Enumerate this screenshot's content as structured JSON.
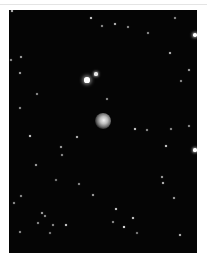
{
  "image": {
    "subject": "star field with central nebula",
    "background_color": "#ffffff",
    "sky_color": "#050505",
    "frame": {
      "left": 9,
      "top": 10,
      "width": 188,
      "height": 243
    }
  },
  "central_object": {
    "x": 103,
    "y": 121,
    "size": 16
  },
  "stars": [
    {
      "x": 87,
      "y": 80,
      "r": 2.6,
      "o": 1.0
    },
    {
      "x": 96,
      "y": 74,
      "r": 1.6,
      "o": 0.9
    },
    {
      "x": 195,
      "y": 35,
      "r": 1.8,
      "o": 1.0
    },
    {
      "x": 195,
      "y": 150,
      "r": 1.6,
      "o": 1.0
    },
    {
      "x": 91,
      "y": 18,
      "r": 1.2,
      "o": 0.9
    },
    {
      "x": 115,
      "y": 24,
      "r": 1.1,
      "o": 0.8
    },
    {
      "x": 102,
      "y": 26,
      "r": 0.9,
      "o": 0.6
    },
    {
      "x": 128,
      "y": 27,
      "r": 0.9,
      "o": 0.6
    },
    {
      "x": 148,
      "y": 33,
      "r": 0.9,
      "o": 0.6
    },
    {
      "x": 175,
      "y": 18,
      "r": 0.9,
      "o": 0.6
    },
    {
      "x": 170,
      "y": 53,
      "r": 1.1,
      "o": 0.8
    },
    {
      "x": 189,
      "y": 70,
      "r": 1.0,
      "o": 0.7
    },
    {
      "x": 181,
      "y": 81,
      "r": 0.9,
      "o": 0.6
    },
    {
      "x": 21,
      "y": 57,
      "r": 1.0,
      "o": 0.7
    },
    {
      "x": 20,
      "y": 73,
      "r": 1.0,
      "o": 0.7
    },
    {
      "x": 11,
      "y": 60,
      "r": 0.9,
      "o": 0.6
    },
    {
      "x": 37,
      "y": 94,
      "r": 0.9,
      "o": 0.6
    },
    {
      "x": 20,
      "y": 108,
      "r": 0.9,
      "o": 0.6
    },
    {
      "x": 107,
      "y": 99,
      "r": 0.9,
      "o": 0.6
    },
    {
      "x": 135,
      "y": 129,
      "r": 1.1,
      "o": 0.9
    },
    {
      "x": 147,
      "y": 130,
      "r": 0.9,
      "o": 0.6
    },
    {
      "x": 171,
      "y": 129,
      "r": 0.9,
      "o": 0.6
    },
    {
      "x": 189,
      "y": 126,
      "r": 0.9,
      "o": 0.6
    },
    {
      "x": 30,
      "y": 136,
      "r": 1.1,
      "o": 0.9
    },
    {
      "x": 77,
      "y": 137,
      "r": 1.1,
      "o": 0.8
    },
    {
      "x": 61,
      "y": 147,
      "r": 1.0,
      "o": 0.7
    },
    {
      "x": 62,
      "y": 155,
      "r": 0.9,
      "o": 0.6
    },
    {
      "x": 166,
      "y": 146,
      "r": 1.2,
      "o": 0.9
    },
    {
      "x": 36,
      "y": 165,
      "r": 1.0,
      "o": 0.7
    },
    {
      "x": 162,
      "y": 177,
      "r": 1.0,
      "o": 0.7
    },
    {
      "x": 163,
      "y": 183,
      "r": 1.0,
      "o": 0.8
    },
    {
      "x": 79,
      "y": 184,
      "r": 0.9,
      "o": 0.6
    },
    {
      "x": 56,
      "y": 180,
      "r": 0.8,
      "o": 0.5
    },
    {
      "x": 93,
      "y": 195,
      "r": 1.0,
      "o": 0.7
    },
    {
      "x": 21,
      "y": 196,
      "r": 0.9,
      "o": 0.6
    },
    {
      "x": 14,
      "y": 203,
      "r": 0.9,
      "o": 0.6
    },
    {
      "x": 174,
      "y": 198,
      "r": 1.0,
      "o": 0.7
    },
    {
      "x": 116,
      "y": 209,
      "r": 1.2,
      "o": 0.9
    },
    {
      "x": 42,
      "y": 213,
      "r": 1.0,
      "o": 0.7
    },
    {
      "x": 45,
      "y": 216,
      "r": 0.9,
      "o": 0.6
    },
    {
      "x": 133,
      "y": 218,
      "r": 1.2,
      "o": 0.9
    },
    {
      "x": 38,
      "y": 223,
      "r": 0.9,
      "o": 0.6
    },
    {
      "x": 66,
      "y": 225,
      "r": 1.2,
      "o": 0.9
    },
    {
      "x": 124,
      "y": 227,
      "r": 1.3,
      "o": 1.0
    },
    {
      "x": 113,
      "y": 222,
      "r": 0.9,
      "o": 0.6
    },
    {
      "x": 53,
      "y": 225,
      "r": 0.9,
      "o": 0.6
    },
    {
      "x": 20,
      "y": 232,
      "r": 0.9,
      "o": 0.6
    },
    {
      "x": 180,
      "y": 235,
      "r": 1.1,
      "o": 0.8
    },
    {
      "x": 137,
      "y": 233,
      "r": 0.8,
      "o": 0.5
    },
    {
      "x": 50,
      "y": 233,
      "r": 0.8,
      "o": 0.5
    },
    {
      "x": 12,
      "y": 11,
      "r": 1.0,
      "o": 0.8
    }
  ]
}
